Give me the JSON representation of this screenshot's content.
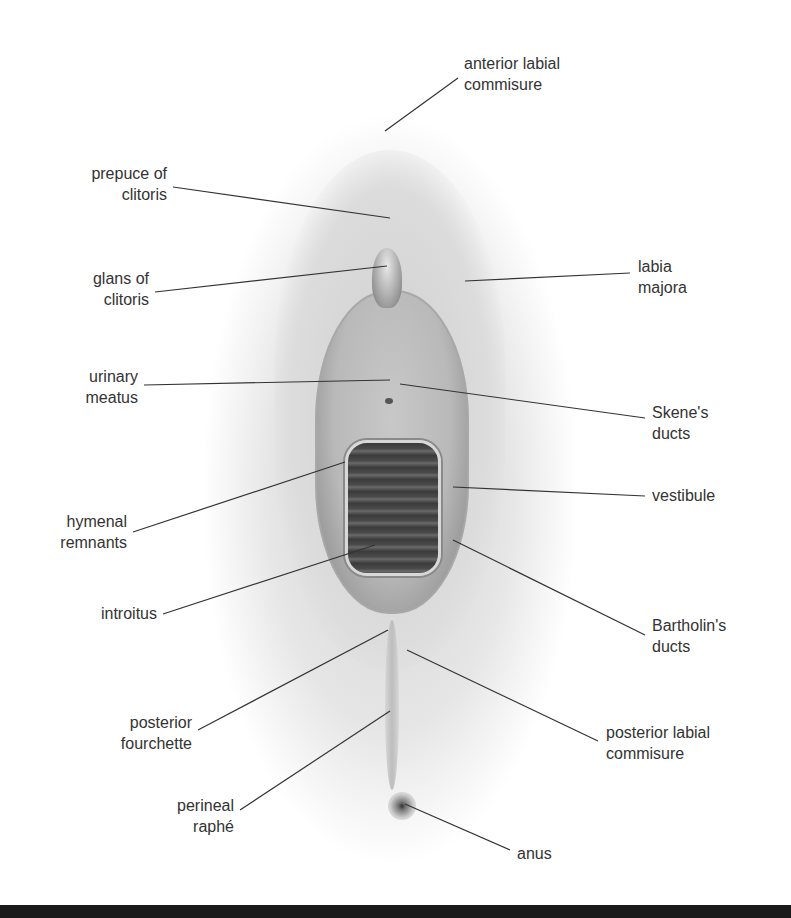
{
  "labels": {
    "anterior_labial_commisure": [
      "anterior labial",
      "commisure"
    ],
    "prepuce_of_clitoris": [
      "prepuce of",
      "clitoris"
    ],
    "glans_of_clitoris": [
      "glans of",
      "clitoris"
    ],
    "labia_majora": [
      "labia",
      "majora"
    ],
    "urinary_meatus": [
      "urinary",
      "meatus"
    ],
    "skenes_ducts": [
      "Skene's",
      "ducts"
    ],
    "hymenal_remnants": [
      "hymenal",
      "remnants"
    ],
    "vestibule": [
      "vestibule"
    ],
    "introitus": [
      "introitus"
    ],
    "bartholins_ducts": [
      "Bartholin's",
      "ducts"
    ],
    "posterior_fourchette": [
      "posterior",
      "fourchette"
    ],
    "posterior_labial_commisure": [
      "posterior labial",
      "commisure"
    ],
    "perineal_raphe": [
      "perineal",
      "raphé"
    ],
    "anus": [
      "anus"
    ]
  }
}
